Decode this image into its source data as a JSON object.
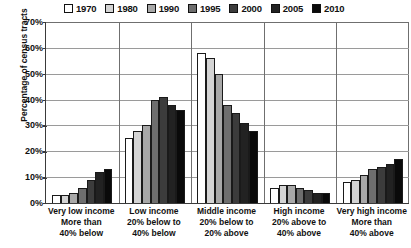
{
  "chart_data": {
    "type": "bar",
    "title": "",
    "xlabel": "",
    "ylabel": "Percentage of census tracts",
    "ylim": [
      0,
      70
    ],
    "ytick_labels": [
      "70%",
      "60%",
      "50%",
      "40%",
      "30%",
      "20%",
      "10%",
      "0%"
    ],
    "ytick_values": [
      70,
      60,
      50,
      40,
      30,
      20,
      10,
      0
    ],
    "grid": true,
    "legend_position": "top",
    "categories": [
      "Very low income More than 40% below",
      "Low income 20% below to 40% below",
      "Middle income 20% below to 20% above",
      "High income 20% above to 40% above",
      "Very high income More than 40% above"
    ],
    "category_lines": [
      [
        "Very low income",
        "More than",
        "40% below"
      ],
      [
        "Low income",
        "20% below to",
        "40% below"
      ],
      [
        "Middle income",
        "20% below to",
        "20% above"
      ],
      [
        "High income",
        "20% above to",
        "40% above"
      ],
      [
        "Very high income",
        "More than",
        "40% above"
      ]
    ],
    "series": [
      {
        "name": "1970",
        "color": "#ffffff",
        "values": [
          3,
          25,
          58,
          6,
          8
        ]
      },
      {
        "name": "1980",
        "color": "#d4d4d4",
        "values": [
          3,
          28,
          56,
          7,
          9
        ]
      },
      {
        "name": "1990",
        "color": "#a8a8a8",
        "values": [
          4,
          30,
          50,
          7,
          11
        ]
      },
      {
        "name": "1995",
        "color": "#6e6e6e",
        "values": [
          6,
          40,
          38,
          6,
          13
        ]
      },
      {
        "name": "2000",
        "color": "#3c3c3c",
        "values": [
          9,
          41,
          35,
          5,
          14
        ]
      },
      {
        "name": "2005",
        "color": "#222222",
        "values": [
          12,
          38,
          31,
          4,
          15
        ]
      },
      {
        "name": "2010",
        "color": "#0a0a0a",
        "values": [
          13,
          36,
          28,
          4,
          17
        ]
      }
    ]
  }
}
